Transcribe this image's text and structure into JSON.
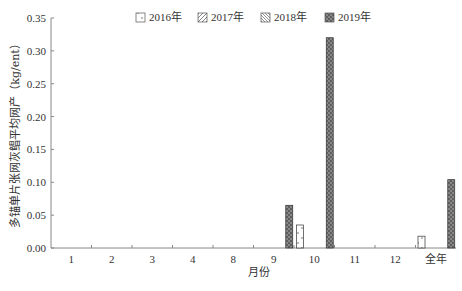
{
  "chart_data": {
    "type": "bar",
    "title": "",
    "xlabel": "月份",
    "ylabel": "多锚单片张网灰鲳平均网产（kg/ent）",
    "ylim": [
      0,
      0.35
    ],
    "yticks": [
      "0.00",
      "0.05",
      "0.10",
      "0.15",
      "0.20",
      "0.25",
      "0.30",
      "0.35"
    ],
    "categories": [
      "1",
      "2",
      "3",
      "4",
      "8",
      "9",
      "10",
      "11",
      "12",
      "全年"
    ],
    "legend_position": "top",
    "series": [
      {
        "name": "2016年",
        "pattern": "sparse-dots",
        "values": [
          0,
          0,
          0,
          0,
          0,
          0,
          0.035,
          0,
          0,
          0.018
        ]
      },
      {
        "name": "2017年",
        "pattern": "diagonal-hatch",
        "values": [
          0,
          0,
          0,
          0,
          0,
          0,
          0,
          0,
          0,
          0
        ]
      },
      {
        "name": "2018年",
        "pattern": "dense-hatch",
        "values": [
          0,
          0,
          0,
          0,
          0,
          0,
          0,
          0,
          0,
          0
        ]
      },
      {
        "name": "2019年",
        "pattern": "diamond-checker",
        "values": [
          0,
          0,
          0,
          0,
          0,
          0.065,
          0.32,
          0,
          0,
          0.104
        ]
      }
    ]
  }
}
